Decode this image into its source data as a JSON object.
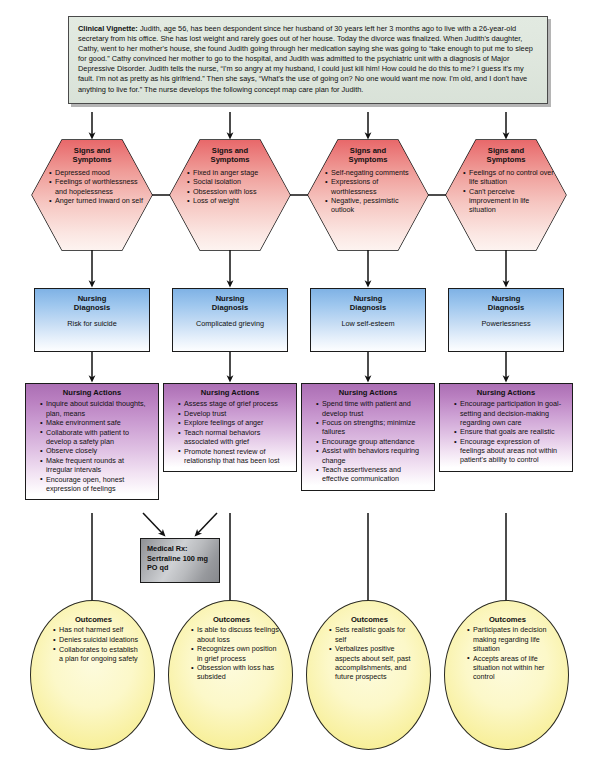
{
  "vignette": {
    "label": "Clinical Vignette:",
    "text": " Judith, age 56, has been despondent since her husband of 30 years left her 3 months ago to live with a 26-year-old secretary from his office. She has lost weight and rarely goes out of her house. Today the divorce was finalized. When Judith's daughter, Cathy, went to her mother's house, she found Judith going through her medication saying she was going to “take enough to put me to sleep for good.” Cathy convinced her mother to go to the hospital, and Judith was admitted to the psychiatric unit with a diagnosis of Major Depressive Disorder. Judith tells the nurse, “I'm so angry at my husband, I could just kill him! How could he do this to me? I guess it's my fault. I'm not as pretty as his girlfriend.” Then she says, “What's the use of going on? No one would want me now. I'm old, and I don't have anything to live for.” The nurse develops the following concept map care plan for Judith."
  },
  "labels": {
    "signs_and_symptoms": "Signs and\nSymptoms",
    "signs_line1": "Signs and",
    "signs_line2": "Symptoms",
    "nursing_diagnosis_line1": "Nursing",
    "nursing_diagnosis_line2": "Diagnosis",
    "nursing_actions": "Nursing Actions",
    "outcomes": "Outcomes"
  },
  "medical_rx": {
    "line1": "Medical Rx:",
    "line2": "Sertraline 100 mg",
    "line3": "PO qd"
  },
  "colors": {
    "vignette_bg": "#dfe7de",
    "hexagon_top": "#e8686a",
    "diagnosis_top": "#7fb2e5",
    "actions_top": "#ab6fb4",
    "outcomes_fill": "#f8f09e",
    "rx_fill": "#b9bbbe",
    "connector": "#111111"
  },
  "columns": [
    {
      "id": "column-1",
      "signs": [
        "Depressed mood",
        "Feelings of worthlessness and hopelessness",
        "Anger turned inward on self"
      ],
      "diagnosis": "Risk for suicide",
      "actions": [
        "Inquire about suicidal thoughts, plan, means",
        "Make environment safe",
        "Collaborate with patient to develop a safety plan",
        "Observe closely",
        "Make frequent rounds at irregular intervals",
        "Encourage open, honest expression of feelings"
      ],
      "outcomes": [
        "Has not harmed self",
        "Denies suicidal ideations",
        "Collaborates to establish a plan for ongoing safety"
      ]
    },
    {
      "id": "column-2",
      "signs": [
        "Fixed in anger stage",
        "Social isolation",
        "Obsession with loss",
        "Loss of weight"
      ],
      "diagnosis": "Complicated grieving",
      "actions": [
        "Assess stage of grief process",
        "Develop trust",
        "Explore feelings of anger",
        "Teach normal behaviors associated with grief",
        "Promote honest review of relationship that has been lost"
      ],
      "outcomes": [
        "Is able to discuss feelings about loss",
        "Recognizes own position in grief process",
        "Obsession with loss has subsided"
      ]
    },
    {
      "id": "column-3",
      "signs": [
        "Self-negating comments",
        "Expressions of worthlessness",
        "Negative, pessimistic outlook"
      ],
      "diagnosis": "Low self-esteem",
      "actions": [
        "Spend time with patient and develop trust",
        "Focus on strengths; minimize failures",
        "Encourage group attendance",
        "Assist with behaviors requiring change",
        "Teach assertiveness and effective communication"
      ],
      "outcomes": [
        "Sets realistic goals for self",
        "Verbalizes positive aspects about self, past accomplishments, and future prospects"
      ]
    },
    {
      "id": "column-4",
      "signs": [
        "Feelings of no control over life situation",
        "Can't perceive improvement in life situation"
      ],
      "diagnosis": "Powerlessness",
      "actions": [
        "Encourage participation in goal-setting and decision-making regarding own care",
        "Ensure that goals are realistic",
        "Encourage expression of feelings about areas not within patient's ability to control"
      ],
      "outcomes": [
        "Participates in decision making regarding life situation",
        "Accepts areas of life situation not within her control"
      ]
    }
  ]
}
